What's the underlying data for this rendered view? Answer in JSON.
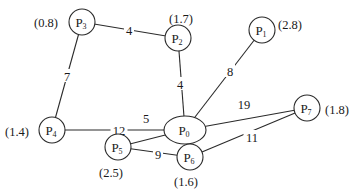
{
  "diagram": {
    "type": "weighted-graph",
    "nodes": [
      {
        "id": "P0",
        "base": "P",
        "sub": "0",
        "value": "",
        "x": 185,
        "y": 130,
        "shape": "ellipse",
        "rx": 21,
        "ry": 14
      },
      {
        "id": "P1",
        "base": "P",
        "sub": "1",
        "value": "(2.8)",
        "x": 262,
        "y": 30,
        "shape": "circle",
        "r": 13,
        "vx": 290,
        "vy": 24
      },
      {
        "id": "P2",
        "base": "P",
        "sub": "2",
        "value": "(1.7)",
        "x": 178,
        "y": 38,
        "shape": "circle",
        "r": 13,
        "vx": 181,
        "vy": 18
      },
      {
        "id": "P3",
        "base": "P",
        "sub": "3",
        "value": "(0.8)",
        "x": 82,
        "y": 22,
        "shape": "circle",
        "r": 13,
        "vx": 46,
        "vy": 22
      },
      {
        "id": "P4",
        "base": "P",
        "sub": "4",
        "value": "(1.4)",
        "x": 52,
        "y": 130,
        "shape": "circle",
        "r": 13,
        "vx": 17,
        "vy": 131
      },
      {
        "id": "P5",
        "base": "P",
        "sub": "5",
        "value": "(2.5)",
        "x": 118,
        "y": 147,
        "shape": "circle",
        "r": 13,
        "vx": 111,
        "vy": 172
      },
      {
        "id": "P6",
        "base": "P",
        "sub": "6",
        "value": "(1.6)",
        "x": 190,
        "y": 157,
        "shape": "circle",
        "r": 13,
        "vx": 186,
        "vy": 181
      },
      {
        "id": "P7",
        "base": "P",
        "sub": "7",
        "value": "(1.8)",
        "x": 307,
        "y": 108,
        "shape": "circle",
        "r": 13,
        "vx": 337,
        "vy": 109
      }
    ],
    "edges": [
      {
        "from": "P3",
        "to": "P2",
        "weight": "4",
        "lx": 129,
        "ly": 30
      },
      {
        "from": "P3",
        "to": "P4",
        "weight": "7",
        "lx": 67,
        "ly": 76
      },
      {
        "from": "P2",
        "to": "P0",
        "weight": "4",
        "lx": 180,
        "ly": 84
      },
      {
        "from": "P1",
        "to": "P0",
        "weight": "8",
        "lx": 230,
        "ly": 71
      },
      {
        "from": "P4",
        "to": "P0",
        "weight": "12",
        "lx": 119,
        "ly": 130
      },
      {
        "from": "P0",
        "to": "P7",
        "weight": "19",
        "lx": 244,
        "ly": 104
      },
      {
        "from": "P0",
        "to": "P5",
        "weight": "5",
        "lx": 146,
        "ly": 118
      },
      {
        "from": "P5",
        "to": "P6",
        "weight": "9",
        "lx": 158,
        "ly": 154
      },
      {
        "from": "P6",
        "to": "P7",
        "weight": "11",
        "lx": 252,
        "ly": 137
      }
    ]
  }
}
